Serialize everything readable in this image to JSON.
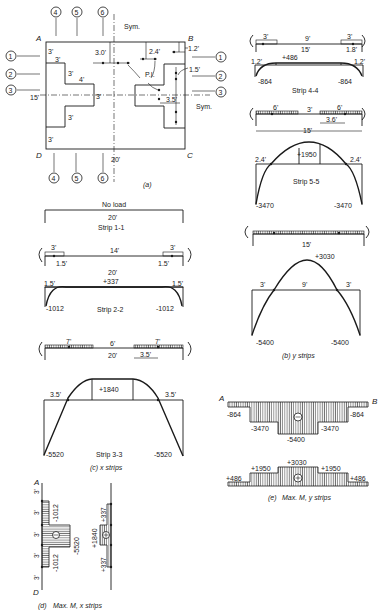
{
  "figure_a": {
    "caption": "(a)",
    "corners": {
      "A": "A",
      "B": "B",
      "C": "C",
      "D": "D"
    },
    "sym_top": "Sym.",
    "sym_right": "Sym.",
    "strip_markers_left": [
      "1",
      "2",
      "3"
    ],
    "strip_markers_top": [
      "4",
      "5",
      "6"
    ],
    "dims": {
      "left_3a": "3'",
      "left_3b": "3'",
      "left_3c": "3'",
      "left_4": "4'",
      "left_3d": "3'",
      "left_3e": "3'",
      "left_15": "15'",
      "center_3": "3'",
      "top_3_0": "3.0'",
      "top_2_4": "2.4'",
      "top_1_2": "1.2'",
      "right_1_5": "1.5'",
      "right_3_5": "3.5'",
      "bottom_20": "20'",
      "pi": "P.I."
    }
  },
  "figure_b": {
    "caption": "(b) y strips",
    "strip44": {
      "label": "Strip 4-4",
      "load_left": "3'",
      "mid": "9'",
      "load_right": "3'",
      "span": "15'",
      "right_dim": "1.8'",
      "left_pi": "1.2'",
      "right_pi": "1.2'",
      "pos": "+486",
      "neg_left": "-864",
      "neg_right": "-864"
    },
    "strip55": {
      "label": "Strip 5-5",
      "load_left": "6'",
      "mid": "3'",
      "load_right": "6'",
      "span": "15'",
      "right_dim": "3.6'",
      "left_pi": "2.4'",
      "right_pi": "2.4'",
      "pos": "+1950",
      "neg_left": "-3470",
      "neg_right": "-3470"
    },
    "strip66": {
      "span": "15'",
      "left_pi": "3'",
      "mid": "9'",
      "right_pi": "3'",
      "pos": "+3030",
      "neg_left": "-5400",
      "neg_right": "-5400"
    }
  },
  "figure_c": {
    "caption": "(c) x strips",
    "strip11": {
      "no_load": "No load",
      "span": "20'",
      "label": "Strip 1-1"
    },
    "strip22": {
      "label": "Strip 2-2",
      "load_left": "3'",
      "mid": "14'",
      "load_right": "3'",
      "span": "20'",
      "left_dim": "1.5'",
      "right_dim": "1.5'",
      "left_pi": "1.5'",
      "right_pi": "1.5'",
      "pos": "+337",
      "neg_left": "-1012",
      "neg_right": "-1012"
    },
    "strip33": {
      "label": "Strip 3-3",
      "load_left": "7'",
      "mid": "6'",
      "load_right": "7'",
      "span": "20'",
      "right_dim": "3.5'",
      "left_pi": "3.5'",
      "right_pi": "3.5'",
      "pos": "+1840",
      "neg_left": "-5520",
      "neg_right": "-5520"
    }
  },
  "figure_d": {
    "caption_prefix": "(d)",
    "caption": "Max. M, x strips",
    "top": "A",
    "bottom": "D",
    "segments": [
      "3'",
      "3'",
      "3'",
      "3'",
      "3'"
    ],
    "neg_1012_top": "-1012",
    "neg_5520": "-5520",
    "neg_1012_bot": "-1012",
    "pos_337_top": "+337",
    "pos_1840": "+1840",
    "pos_337_bot": "+337",
    "minus": "−",
    "plus": "+"
  },
  "figure_e": {
    "caption_prefix": "(e)",
    "caption": "Max. M, y strips",
    "left": "A",
    "right": "B",
    "neg": [
      "-864",
      "-3470",
      "-5400",
      "-3470",
      "-864"
    ],
    "pos": [
      "+486",
      "+1950",
      "+3030",
      "+1950",
      "+486"
    ],
    "minus": "−",
    "plus": "+"
  }
}
